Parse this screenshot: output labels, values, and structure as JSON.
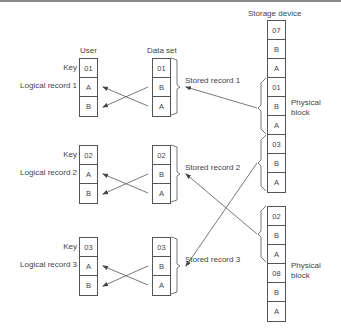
{
  "headers": {
    "user": "User",
    "data_set": "Data set",
    "storage_device": "Storage device"
  },
  "groups": [
    {
      "key_label": "Key",
      "record_label": "Logical record 1",
      "user_cells": [
        "01",
        "A",
        "B"
      ],
      "dataset_cells": [
        "01",
        "B",
        "A"
      ],
      "stored_label": "Stored record 1"
    },
    {
      "key_label": "Key",
      "record_label": "Logical record 2",
      "user_cells": [
        "02",
        "A",
        "B"
      ],
      "dataset_cells": [
        "02",
        "B",
        "A"
      ],
      "stored_label": "Stored record 2"
    },
    {
      "key_label": "Key",
      "record_label": "Logical record 3",
      "user_cells": [
        "03",
        "A",
        "B"
      ],
      "dataset_cells": [
        "03",
        "B",
        "A"
      ],
      "stored_label": "Stored record 3"
    }
  ],
  "storage": {
    "block1_cells": [
      "07",
      "B",
      "A",
      "01",
      "B",
      "A",
      "03",
      "B",
      "A"
    ],
    "block2_cells": [
      "02",
      "B",
      "A",
      "08",
      "B",
      "A"
    ],
    "physical_block_labels": [
      {
        "line1": "Physical",
        "line2": "block"
      },
      {
        "line1": "Physical",
        "line2": "block"
      }
    ]
  }
}
